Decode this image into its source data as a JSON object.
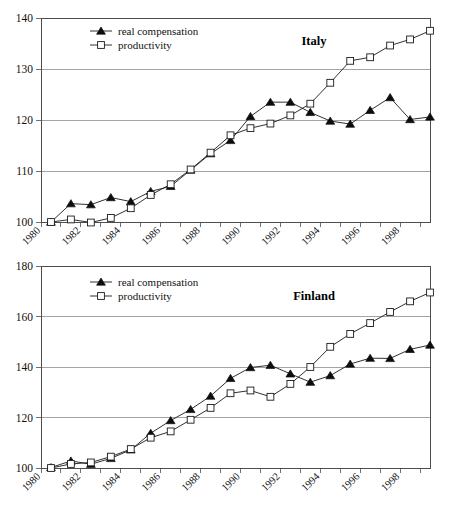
{
  "figure": {
    "background_color": "#ffffff",
    "line_color": "#1a1a1a",
    "grid_color": "#8c8c8c"
  },
  "chart_data": [
    {
      "type": "line",
      "title": "Italy",
      "xlabel": "",
      "ylabel": "",
      "xlim": [
        1980,
        1999.5
      ],
      "ylim": [
        100,
        140
      ],
      "yticks": [
        100,
        110,
        120,
        130,
        140
      ],
      "ytick_labels": [
        "100",
        "110",
        "120",
        "130",
        "140"
      ],
      "xticks": [
        1980,
        1982,
        1984,
        1986,
        1988,
        1990,
        1992,
        1994,
        1996,
        1998
      ],
      "xtick_labels": [
        "1980",
        "1982",
        "1984",
        "1986",
        "1988",
        "1990",
        "1992",
        "1994",
        "1996",
        "1998"
      ],
      "minor_xticks_every": 1,
      "grid": true,
      "legend_position": "upper-left",
      "x": [
        1980.5,
        1981.5,
        1982.5,
        1983.5,
        1984.5,
        1985.5,
        1986.5,
        1987.5,
        1988.5,
        1989.5,
        1990.5,
        1991.5,
        1992.5,
        1993.5,
        1994.5,
        1995.5,
        1996.5,
        1997.5,
        1998.5,
        1999.5
      ],
      "series": [
        {
          "name": "real compensation",
          "marker": "filled-triangle",
          "values": [
            100.0,
            103.6,
            103.4,
            104.8,
            104.0,
            106.0,
            107.0,
            110.2,
            113.4,
            116.0,
            120.7,
            123.5,
            123.5,
            121.5,
            119.8,
            119.2,
            121.9,
            124.4,
            120.1,
            120.6
          ]
        },
        {
          "name": "productivity",
          "marker": "open-square",
          "values": [
            100.0,
            100.5,
            99.9,
            100.8,
            102.7,
            105.3,
            107.4,
            110.3,
            113.6,
            117.0,
            118.4,
            119.3,
            120.9,
            123.2,
            127.3,
            131.6,
            132.3,
            134.6,
            135.8,
            137.5
          ]
        }
      ]
    },
    {
      "type": "line",
      "title": "Finland",
      "xlabel": "",
      "ylabel": "",
      "xlim": [
        1980,
        1999.5
      ],
      "ylim": [
        100,
        180
      ],
      "yticks": [
        100,
        120,
        140,
        160,
        180
      ],
      "ytick_labels": [
        "100",
        "120",
        "140",
        "160",
        "180"
      ],
      "xticks": [
        1980,
        1982,
        1984,
        1986,
        1988,
        1990,
        1992,
        1994,
        1996,
        1998
      ],
      "xtick_labels": [
        "1980",
        "1982",
        "1984",
        "1986",
        "1988",
        "1990",
        "1992",
        "1994",
        "1996",
        "1998"
      ],
      "minor_xticks_every": 1,
      "grid": true,
      "legend_position": "upper-left",
      "x": [
        1980.5,
        1981.5,
        1982.5,
        1983.5,
        1984.5,
        1985.5,
        1986.5,
        1987.5,
        1988.5,
        1989.5,
        1990.5,
        1991.5,
        1992.5,
        1993.5,
        1994.5,
        1995.5,
        1996.5,
        1997.5,
        1998.5,
        1999.5
      ],
      "series": [
        {
          "name": "real compensation",
          "marker": "filled-triangle",
          "values": [
            100.2,
            102.8,
            101.5,
            103.8,
            107.2,
            113.8,
            118.8,
            123.2,
            128.5,
            135.5,
            139.8,
            140.7,
            137.3,
            134.0,
            136.6,
            141.2,
            143.5,
            143.4,
            147.0,
            148.7
          ]
        },
        {
          "name": "productivity",
          "marker": "open-square",
          "values": [
            100.0,
            101.6,
            102.2,
            104.5,
            107.5,
            112.0,
            114.5,
            119.1,
            123.8,
            129.6,
            130.7,
            128.2,
            133.3,
            140.0,
            148.0,
            153.1,
            157.4,
            161.8,
            166.0,
            169.5
          ]
        }
      ]
    }
  ]
}
